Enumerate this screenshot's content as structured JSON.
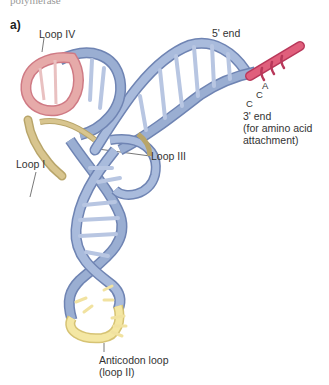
{
  "figure": {
    "top_fragment": "polymerase",
    "panel_label": "a)",
    "labels": {
      "loop_iv": "Loop IV",
      "five_prime_end": "5' end",
      "three_prime_end": "3' end",
      "three_prime_note": "(for amino acid",
      "three_prime_note2": "attachment)",
      "loop_i": "Loop I",
      "loop_iii": "Loop III",
      "anticodon_loop": "Anticodon loop",
      "anticodon_loop_alt": "(loop II)",
      "base_a": "A",
      "base_c1": "C",
      "base_c2": "C"
    },
    "colors": {
      "backbone_blue": "#9aaed2",
      "backbone_blue_dark": "#6f84b3",
      "loop_iv_pink": "#e6aaa9",
      "loop_iv_pink_dark": "#cf7a84",
      "loop_i_tan": "#d8c58f",
      "anticodon_yellow": "#f4e7a3",
      "acceptor_magenta": "#d9506e"
    }
  }
}
